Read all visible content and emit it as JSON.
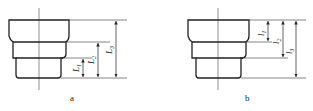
{
  "figures": [
    {
      "id": "a",
      "caption": "a",
      "dimensions": [
        {
          "label": "L",
          "sub": "1",
          "from": "middle/bottom step boundary",
          "to": "bottom face"
        },
        {
          "label": "L",
          "sub": "2",
          "from": "top/middle step boundary",
          "to": "bottom face"
        },
        {
          "label": "L",
          "sub": "3",
          "from": "top face",
          "to": "bottom face"
        }
      ],
      "reference": "bottom face"
    },
    {
      "id": "b",
      "caption": "b",
      "dimensions": [
        {
          "label": "l",
          "sub": "1",
          "from": "top face",
          "to": "top/middle step boundary"
        },
        {
          "label": "l",
          "sub": "2",
          "from": "top face",
          "to": "middle/bottom step boundary"
        },
        {
          "label": "l",
          "sub": "3",
          "from": "top face",
          "to": "bottom face"
        }
      ],
      "reference": "top face"
    }
  ],
  "colors": {
    "line": "#222222",
    "background": "#ffffff"
  }
}
